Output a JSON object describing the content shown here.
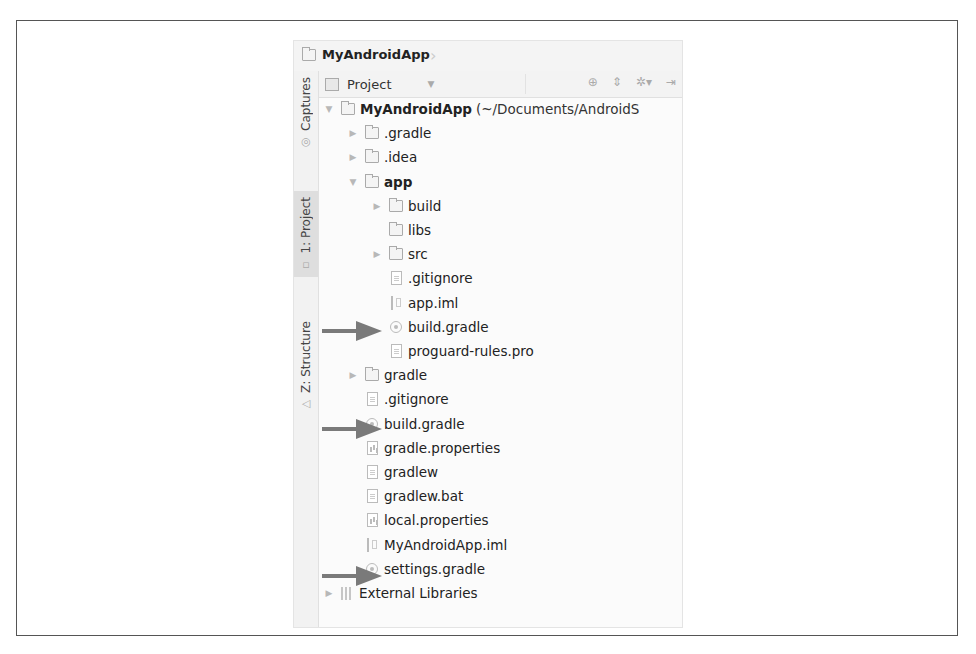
{
  "navbar": {
    "project_name": "MyAndroidApp"
  },
  "tool_stripe": {
    "buttons": [
      {
        "label": "Captures",
        "active": false
      },
      {
        "label": "1: Project",
        "active": true
      },
      {
        "label": "Z: Structure",
        "active": false
      }
    ]
  },
  "toolbar": {
    "view_mode": "Project",
    "icons": [
      "locate-icon",
      "collapse-all-icon",
      "settings-icon",
      "hide-icon"
    ]
  },
  "tree": {
    "root": {
      "label": "MyAndroidApp",
      "path": "(~/Documents/AndroidS"
    },
    "items": [
      {
        "label": ".gradle",
        "type": "folder",
        "depth": 1,
        "toggle": "collapsed"
      },
      {
        "label": ".idea",
        "type": "folder",
        "depth": 1,
        "toggle": "collapsed"
      },
      {
        "label": "app",
        "type": "folder",
        "depth": 1,
        "toggle": "expanded",
        "bold": true
      },
      {
        "label": "build",
        "type": "folder",
        "depth": 2,
        "toggle": "collapsed"
      },
      {
        "label": "libs",
        "type": "folder",
        "depth": 2,
        "toggle": "none"
      },
      {
        "label": "src",
        "type": "folder",
        "depth": 2,
        "toggle": "collapsed"
      },
      {
        "label": ".gitignore",
        "type": "file",
        "depth": 2,
        "toggle": "none"
      },
      {
        "label": "app.iml",
        "type": "iml",
        "depth": 2,
        "toggle": "none"
      },
      {
        "label": "build.gradle",
        "type": "gradle",
        "depth": 2,
        "toggle": "none",
        "highlighted": true
      },
      {
        "label": "proguard-rules.pro",
        "type": "file",
        "depth": 2,
        "toggle": "none"
      },
      {
        "label": "gradle",
        "type": "folder",
        "depth": 1,
        "toggle": "collapsed"
      },
      {
        "label": ".gitignore",
        "type": "file",
        "depth": 1,
        "toggle": "none"
      },
      {
        "label": "build.gradle",
        "type": "gradle",
        "depth": 1,
        "toggle": "none",
        "highlighted": true
      },
      {
        "label": "gradle.properties",
        "type": "props",
        "depth": 1,
        "toggle": "none"
      },
      {
        "label": "gradlew",
        "type": "file",
        "depth": 1,
        "toggle": "none"
      },
      {
        "label": "gradlew.bat",
        "type": "file",
        "depth": 1,
        "toggle": "none"
      },
      {
        "label": "local.properties",
        "type": "props",
        "depth": 1,
        "toggle": "none"
      },
      {
        "label": "MyAndroidApp.iml",
        "type": "iml",
        "depth": 1,
        "toggle": "none"
      },
      {
        "label": "settings.gradle",
        "type": "gradle",
        "depth": 1,
        "toggle": "none",
        "highlighted": true
      }
    ],
    "external": {
      "label": "External Libraries",
      "toggle": "collapsed"
    }
  },
  "colors": {
    "arrow": "#7a7a7a",
    "frame_border": "#555555"
  }
}
